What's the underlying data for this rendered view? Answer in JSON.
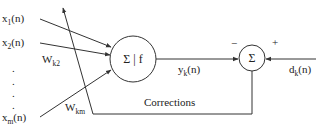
{
  "diagram": {
    "type": "neuron-error-correction-learning",
    "colors": {
      "stroke": "#333333",
      "text": "#222222",
      "background": "#ffffff"
    },
    "inputs": [
      {
        "base": "x",
        "sub": "1",
        "arg": "(n)"
      },
      {
        "base": "x",
        "sub": "2",
        "arg": "(n)"
      },
      {
        "base": "x",
        "sub": "m",
        "arg": "(n)"
      }
    ],
    "ellipsis_dots": [
      ".",
      ".",
      ".",
      "."
    ],
    "weights": [
      {
        "base": "W",
        "sub": "k2"
      },
      {
        "base": "W",
        "sub": "km"
      }
    ],
    "neuron": {
      "label": "Σ | f"
    },
    "output": {
      "base": "y",
      "sub": "k",
      "arg": "(n)"
    },
    "summing_junction": {
      "label": "Σ",
      "minus_sign": "−",
      "plus_sign": "+"
    },
    "desired": {
      "base": "d",
      "sub": "k",
      "arg": "(n)"
    },
    "feedback_label": "Corrections"
  }
}
